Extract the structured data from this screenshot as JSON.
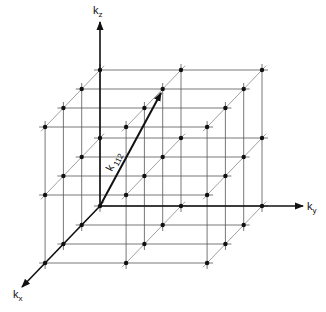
{
  "figure": {
    "type": "reciprocal lattice diagram",
    "axes": {
      "kx": {
        "label": "k",
        "subscript": "x"
      },
      "ky": {
        "label": "k",
        "subscript": "y"
      },
      "kz": {
        "label": "k",
        "subscript": "z"
      }
    },
    "vector": {
      "label": "k",
      "subscript": "112",
      "indices": [
        1,
        1,
        2
      ]
    },
    "lattice": {
      "nx": 4,
      "ny": 3,
      "nz": 3
    },
    "colors": {
      "ink": "#111111",
      "grid": "#555555",
      "background": "#ffffff"
    }
  }
}
